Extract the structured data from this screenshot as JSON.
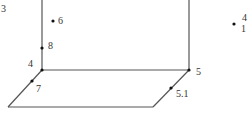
{
  "diagram": {
    "type": "3d-box-point-labels",
    "colors": {
      "line": "#555555",
      "point": "#111111",
      "text": "#333333",
      "background": "#ffffff"
    },
    "lines": [
      {
        "id": "left-vertical",
        "x1": 42,
        "y1": 0,
        "x2": 42,
        "y2": 70
      },
      {
        "id": "right-vertical",
        "x1": 189,
        "y1": 0,
        "x2": 189,
        "y2": 70
      },
      {
        "id": "back-floor-edge",
        "x1": 42,
        "y1": 70,
        "x2": 189,
        "y2": 70
      },
      {
        "id": "left-floor-diagonal",
        "x1": 42,
        "y1": 70,
        "x2": 8,
        "y2": 107
      },
      {
        "id": "right-floor-diagonal",
        "x1": 189,
        "y1": 70,
        "x2": 153,
        "y2": 107
      },
      {
        "id": "front-floor-edge",
        "x1": 8,
        "y1": 107,
        "x2": 153,
        "y2": 107
      }
    ],
    "points": [
      {
        "id": "p6",
        "label": "6",
        "x": 53,
        "y": 21
      },
      {
        "id": "p8",
        "label": "8",
        "x": 42,
        "y": 48
      },
      {
        "id": "p4",
        "label": "4",
        "x": 42,
        "y": 70
      },
      {
        "id": "p7",
        "label": "7",
        "x": 32,
        "y": 81
      },
      {
        "id": "p5",
        "label": "5",
        "x": 189,
        "y": 70
      },
      {
        "id": "p5_1",
        "label": "5.1",
        "x": 171,
        "y": 88
      },
      {
        "id": "p-right",
        "label": "",
        "x": 234,
        "y": 24
      }
    ],
    "labels": [
      {
        "id": "label-3",
        "text": "3",
        "x": 1,
        "y": 4
      },
      {
        "id": "label-6",
        "text": "6",
        "x": 58,
        "y": 16
      },
      {
        "id": "label-8",
        "text": "8",
        "x": 48,
        "y": 41
      },
      {
        "id": "label-4",
        "text": "4",
        "x": 28,
        "y": 59
      },
      {
        "id": "label-7",
        "text": "7",
        "x": 36,
        "y": 84
      },
      {
        "id": "label-5",
        "text": "5",
        "x": 196,
        "y": 67
      },
      {
        "id": "label-5-1",
        "text": "5.1",
        "x": 176,
        "y": 89
      },
      {
        "id": "label-right-top",
        "text": "4",
        "x": 242,
        "y": 13
      },
      {
        "id": "label-right-bottom",
        "text": "1",
        "x": 241,
        "y": 24
      }
    ]
  }
}
